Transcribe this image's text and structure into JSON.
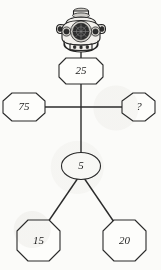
{
  "diagram": {
    "type": "number-puzzle-tree",
    "icon": {
      "name": "diving-helmet-icon",
      "label": "Diving Helmet"
    },
    "nodes": [
      {
        "id": "n25",
        "label": "25",
        "shape": "octagon",
        "cx": 81,
        "cy": 71,
        "rx": 22,
        "ry": 13
      },
      {
        "id": "n75",
        "label": "75",
        "shape": "octagon",
        "cx": 24,
        "cy": 107,
        "rx": 21,
        "ry": 15
      },
      {
        "id": "nq",
        "label": "?",
        "shape": "octagon",
        "cx": 139,
        "cy": 107,
        "rx": 17,
        "ry": 14
      },
      {
        "id": "n5",
        "label": "5",
        "shape": "ellipse",
        "cx": 81,
        "cy": 166,
        "rx": 19,
        "ry": 14
      },
      {
        "id": "n15",
        "label": "15",
        "shape": "octagon",
        "cx": 38,
        "cy": 240,
        "rx": 22,
        "ry": 20
      },
      {
        "id": "n20",
        "label": "20",
        "shape": "octagon",
        "cx": 124,
        "cy": 240,
        "rx": 22,
        "ry": 20
      }
    ],
    "edges": [
      {
        "from": "helmet",
        "to": "n25",
        "x1": 81,
        "y1": 52,
        "x2": 81,
        "y2": 58
      },
      {
        "from": "n25",
        "to": "cross",
        "x1": 81,
        "y1": 84,
        "x2": 81,
        "y2": 107
      },
      {
        "from": "n75",
        "to": "cross",
        "x1": 45,
        "y1": 107,
        "x2": 81,
        "y2": 107
      },
      {
        "from": "cross",
        "to": "nq",
        "x1": 81,
        "y1": 107,
        "x2": 122,
        "y2": 107
      },
      {
        "from": "cross",
        "to": "n5",
        "x1": 81,
        "y1": 107,
        "x2": 81,
        "y2": 152
      },
      {
        "from": "n5",
        "to": "n15",
        "x1": 78,
        "y1": 179,
        "x2": 47,
        "y2": 222
      },
      {
        "from": "n5",
        "to": "n20",
        "x1": 84,
        "y1": 179,
        "x2": 115,
        "y2": 222
      }
    ],
    "colors": {
      "ink": "#2b2b2b",
      "paper": "#fbfbf9",
      "node_fill": "#fdfdfb"
    }
  }
}
